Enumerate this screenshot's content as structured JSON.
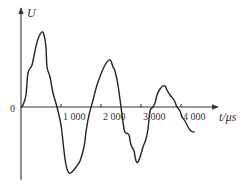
{
  "chart_data": {
    "type": "line",
    "title": "",
    "xlabel": "t/μs",
    "ylabel": "U",
    "origin_label": "0",
    "x_ticks": [
      1000,
      2000,
      3000,
      4000
    ],
    "x_tick_labels": [
      "1 000",
      "2 000",
      "3 000",
      "4 000"
    ],
    "y_ticks": [],
    "xlim": [
      0,
      4800
    ],
    "ylim": [
      -75,
      100
    ],
    "grid": false,
    "legend": null,
    "y_units": "relative (no tick values shown)",
    "series": [
      {
        "name": "U(t)",
        "color": "#222222",
        "t": [
          0,
          50,
          125,
          175,
          275,
          350,
          425,
          525,
          575,
          625,
          650,
          725,
          800,
          900,
          1000,
          1050,
          1100,
          1150,
          1200,
          1275,
          1375,
          1475,
          1575,
          1625,
          1700,
          1800,
          1900,
          2000,
          2100,
          2200,
          2250,
          2300,
          2350,
          2425,
          2500,
          2575,
          2625,
          2700,
          2750,
          2825,
          2875,
          2925,
          3000,
          3050,
          3125,
          3175,
          3225,
          3300,
          3350,
          3400,
          3475,
          3550,
          3600,
          3650,
          3725,
          3825,
          3900,
          3975,
          4025,
          4100,
          4175,
          4250,
          4325
        ],
        "U": [
          0,
          2,
          12,
          34,
          42,
          56,
          68,
          75,
          72,
          60,
          40,
          30,
          14,
          0,
          -18,
          -35,
          -52,
          -62,
          -66,
          -65,
          -60,
          -54,
          -40,
          -25,
          -8,
          7,
          22,
          33,
          42,
          47,
          46,
          40,
          36,
          22,
          0,
          -22,
          -26,
          -28,
          -38,
          -44,
          -54,
          -55,
          -47,
          -40,
          -32,
          -22,
          -4,
          0,
          4,
          12,
          18,
          21,
          21,
          17,
          12,
          7,
          0,
          -4,
          -10,
          -14,
          -20,
          -24,
          -25
        ]
      }
    ]
  }
}
